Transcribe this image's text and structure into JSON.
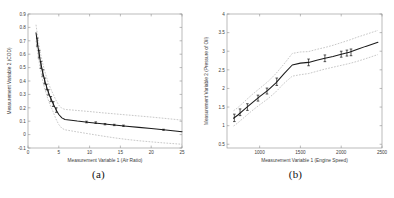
{
  "figure": {
    "panels": [
      {
        "id": "a",
        "caption": "(a)",
        "xlabel": "Measurement Variable 1 (Air Ratio)",
        "ylabel": "Measurement Variable 2 (COD)"
      },
      {
        "id": "b",
        "caption": "(b)",
        "xlabel": "Measurement Variable 1 (Engine Speed)",
        "ylabel": "Measurement Variable 2 (Pressure of Oil)"
      }
    ]
  },
  "chart_data": [
    {
      "type": "line",
      "panel": "a",
      "title": "",
      "xlabel": "Measurement Variable 1 (Air Ratio)",
      "ylabel": "Measurement Variable 2 (COD)",
      "xlim": [
        0,
        25
      ],
      "ylim": [
        -0.1,
        0.9
      ],
      "xticks": [
        0,
        5,
        10,
        15,
        20,
        25
      ],
      "yticks": [
        -0.1,
        0,
        0.1,
        0.2,
        0.3,
        0.4,
        0.5,
        0.6,
        0.7,
        0.8,
        0.9
      ],
      "grid": false,
      "legend": "none",
      "series": [
        {
          "name": "fitted mean",
          "style": "solid",
          "x": [
            1.3,
            1.6,
            2.0,
            2.4,
            2.8,
            3.2,
            3.6,
            4.0,
            4.5,
            5.0,
            5.5,
            6.0,
            7.0,
            8.0,
            10.0,
            12.0,
            14.0,
            16.0,
            18.0,
            20.0,
            22.0,
            25.0
          ],
          "y": [
            0.76,
            0.66,
            0.55,
            0.46,
            0.39,
            0.33,
            0.28,
            0.24,
            0.19,
            0.15,
            0.125,
            0.113,
            0.107,
            0.101,
            0.091,
            0.081,
            0.072,
            0.063,
            0.054,
            0.045,
            0.036,
            0.022
          ]
        },
        {
          "name": "upper confidence band",
          "style": "dashed",
          "x": [
            1.3,
            1.6,
            2.0,
            2.4,
            2.8,
            3.2,
            3.6,
            4.0,
            4.5,
            5.0,
            5.5,
            6.0,
            7.0,
            8.0,
            10.0,
            12.0,
            14.0,
            16.0,
            18.0,
            20.0,
            22.0,
            25.0
          ],
          "y": [
            0.82,
            0.72,
            0.61,
            0.53,
            0.46,
            0.4,
            0.35,
            0.31,
            0.26,
            0.22,
            0.196,
            0.188,
            0.184,
            0.18,
            0.172,
            0.163,
            0.155,
            0.147,
            0.139,
            0.131,
            0.122,
            0.108
          ]
        },
        {
          "name": "lower confidence band",
          "style": "dashed",
          "x": [
            1.3,
            1.6,
            2.0,
            2.4,
            2.8,
            3.2,
            3.6,
            4.0,
            4.5,
            5.0,
            5.5,
            6.0,
            7.0,
            8.0,
            10.0,
            12.0,
            14.0,
            16.0,
            18.0,
            20.0,
            22.0,
            25.0
          ],
          "y": [
            0.7,
            0.6,
            0.49,
            0.4,
            0.33,
            0.27,
            0.22,
            0.18,
            0.12,
            0.075,
            0.047,
            0.036,
            0.028,
            0.02,
            0.005,
            -0.01,
            -0.024,
            -0.036,
            -0.046,
            -0.054,
            -0.062,
            -0.072
          ]
        }
      ],
      "error_bars": {
        "x": [
          1.5,
          1.8,
          2.1,
          2.4,
          2.7,
          3.0,
          3.3,
          3.7,
          4.1,
          4.6,
          9.5,
          11.0,
          12.5,
          14.0,
          15.5,
          22.0
        ],
        "y": [
          0.69,
          0.6,
          0.52,
          0.46,
          0.4,
          0.355,
          0.315,
          0.265,
          0.228,
          0.183,
          0.094,
          0.089,
          0.078,
          0.072,
          0.066,
          0.036
        ],
        "err": [
          0.03,
          0.028,
          0.026,
          0.024,
          0.022,
          0.021,
          0.02,
          0.019,
          0.018,
          0.017,
          0.006,
          0.006,
          0.005,
          0.005,
          0.005,
          0.004
        ]
      }
    },
    {
      "type": "line",
      "panel": "b",
      "title": "",
      "xlabel": "Measurement Variable 1 (Engine Speed)",
      "ylabel": "Measurement Variable 2 (Pressure of Oil)",
      "xlim": [
        600,
        2500
      ],
      "ylim": [
        0.4,
        4.0
      ],
      "xticks": [
        1000,
        1500,
        2000,
        2500
      ],
      "yticks": [
        0.5,
        1.0,
        1.5,
        2.0,
        2.5,
        3.0,
        3.5,
        4.0
      ],
      "grid": false,
      "legend": "none",
      "series": [
        {
          "name": "fitted mean",
          "style": "solid",
          "x": [
            680,
            730,
            820,
            900,
            1000,
            1100,
            1200,
            1300,
            1400,
            1500,
            1600,
            1700,
            1800,
            1900,
            2000,
            2100,
            2200,
            2300,
            2450
          ],
          "y": [
            1.2,
            1.28,
            1.45,
            1.6,
            1.78,
            1.95,
            2.15,
            2.4,
            2.63,
            2.68,
            2.7,
            2.76,
            2.81,
            2.86,
            2.92,
            2.97,
            3.05,
            3.13,
            3.24
          ]
        },
        {
          "name": "upper confidence band",
          "style": "dashed",
          "x": [
            680,
            730,
            820,
            900,
            1000,
            1100,
            1200,
            1300,
            1400,
            1500,
            1600,
            1700,
            1800,
            1900,
            2000,
            2100,
            2200,
            2300,
            2450
          ],
          "y": [
            1.4,
            1.48,
            1.66,
            1.82,
            2.0,
            2.18,
            2.4,
            2.66,
            2.94,
            2.98,
            2.99,
            3.05,
            3.1,
            3.16,
            3.23,
            3.3,
            3.38,
            3.45,
            3.56
          ]
        },
        {
          "name": "lower confidence band",
          "style": "dashed",
          "x": [
            680,
            730,
            820,
            900,
            1000,
            1100,
            1200,
            1300,
            1400,
            1500,
            1600,
            1700,
            1800,
            1900,
            2000,
            2100,
            2200,
            2300,
            2450
          ],
          "y": [
            0.99,
            1.07,
            1.24,
            1.39,
            1.56,
            1.72,
            1.91,
            2.14,
            2.33,
            2.37,
            2.4,
            2.46,
            2.52,
            2.57,
            2.62,
            2.67,
            2.73,
            2.8,
            2.91
          ]
        }
      ],
      "error_bars": {
        "x": [
          690,
          760,
          850,
          980,
          1090,
          1210,
          1600,
          1800,
          2000,
          2070,
          2120
        ],
        "y": [
          1.21,
          1.36,
          1.5,
          1.74,
          1.93,
          2.18,
          2.7,
          2.81,
          2.92,
          2.95,
          2.97
        ],
        "err": [
          0.1,
          0.09,
          0.09,
          0.08,
          0.08,
          0.1,
          0.09,
          0.09,
          0.08,
          0.08,
          0.09
        ]
      }
    }
  ]
}
